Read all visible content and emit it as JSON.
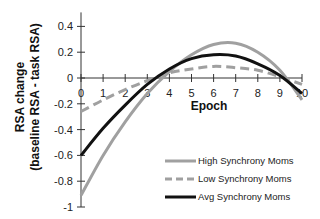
{
  "chart_data": {
    "type": "line",
    "title": "",
    "xlabel": "Epoch",
    "ylabel_line1": "RSA change",
    "ylabel_line2": "(baseline RSA - task RSA)",
    "xlim": [
      0,
      10
    ],
    "ylim": [
      -1,
      0.4
    ],
    "x_ticks": [
      "0",
      "1",
      "2",
      "3",
      "4",
      "5",
      "6",
      "7",
      "8",
      "9",
      "10"
    ],
    "y_ticks": [
      "0.4",
      "0.2",
      "0",
      "-0.2",
      "-0.4",
      "-0.6",
      "-0.8",
      "-1"
    ],
    "y_tick_values": [
      0.4,
      0.2,
      0,
      -0.2,
      -0.4,
      -0.6,
      -0.8,
      -1
    ],
    "grid": false,
    "legend_position": "bottom-right",
    "x": [
      0,
      1,
      2,
      3,
      4,
      5,
      6,
      7,
      8,
      9,
      10
    ],
    "series": [
      {
        "name": "High Synchrony Moms",
        "style": "solid",
        "color": "#a0a0a0",
        "values": [
          -0.91,
          -0.6,
          -0.34,
          -0.12,
          0.05,
          0.18,
          0.26,
          0.27,
          0.2,
          0.06,
          -0.17
        ]
      },
      {
        "name": "Low Synchrony Moms",
        "style": "dashed",
        "color": "#a0a0a0",
        "values": [
          -0.26,
          -0.17,
          -0.09,
          -0.02,
          0.04,
          0.07,
          0.09,
          0.08,
          0.06,
          0.01,
          -0.05
        ]
      },
      {
        "name": "Avg Synchrony Moms",
        "style": "solid",
        "color": "#111111",
        "values": [
          -0.6,
          -0.39,
          -0.21,
          -0.05,
          0.07,
          0.15,
          0.18,
          0.17,
          0.11,
          0.02,
          -0.12
        ]
      }
    ]
  }
}
